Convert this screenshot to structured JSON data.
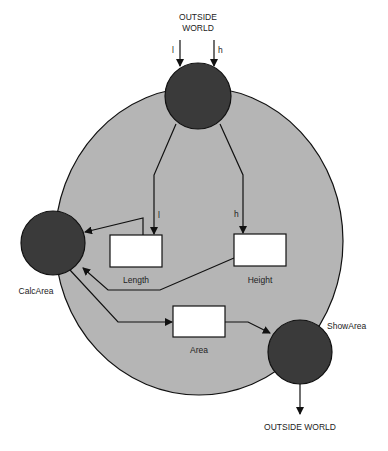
{
  "diagram": {
    "type": "data-flow",
    "colors": {
      "boundary_fill": "#b5b5b5",
      "process_fill": "#3a3a3a",
      "store_fill": "#ffffff",
      "stroke": "#111111"
    },
    "top_input": {
      "label_line1": "OUTSIDE",
      "label_line2": "WORLD",
      "flow_l": "l",
      "flow_h": "h"
    },
    "inner_flows": {
      "to_length": "l",
      "to_height": "h"
    },
    "processes": [
      {
        "id": "input",
        "label": ""
      },
      {
        "id": "calc",
        "label": "CalcArea"
      },
      {
        "id": "show",
        "label": "ShowArea"
      }
    ],
    "stores": [
      {
        "id": "length",
        "label": "Length"
      },
      {
        "id": "height",
        "label": "Height"
      },
      {
        "id": "area",
        "label": "Area"
      }
    ],
    "bottom_output": {
      "label": "OUTSIDE WORLD"
    }
  }
}
